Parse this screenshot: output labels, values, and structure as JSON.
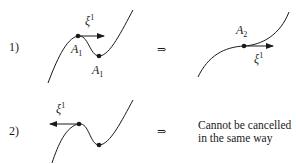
{
  "figure": {
    "rows": [
      {
        "index_label": "1)",
        "left_panel": {
          "vector_label": "ξ",
          "vector_sup": "1",
          "vector_direction": "right",
          "point_labels": [
            {
              "base": "A",
              "sub": "1"
            },
            {
              "base": "A",
              "sub": "1"
            }
          ]
        },
        "implies": "⇒",
        "right_panel": {
          "point_label": {
            "base": "A",
            "sub": "2"
          },
          "vector_label": "ξ",
          "vector_sup": "1"
        }
      },
      {
        "index_label": "2)",
        "left_panel": {
          "vector_label": "ξ",
          "vector_sup": "1",
          "vector_direction": "left"
        },
        "implies": "⇒",
        "note_line1": "Cannot be cancelled",
        "note_line2": "in the same way"
      }
    ]
  }
}
